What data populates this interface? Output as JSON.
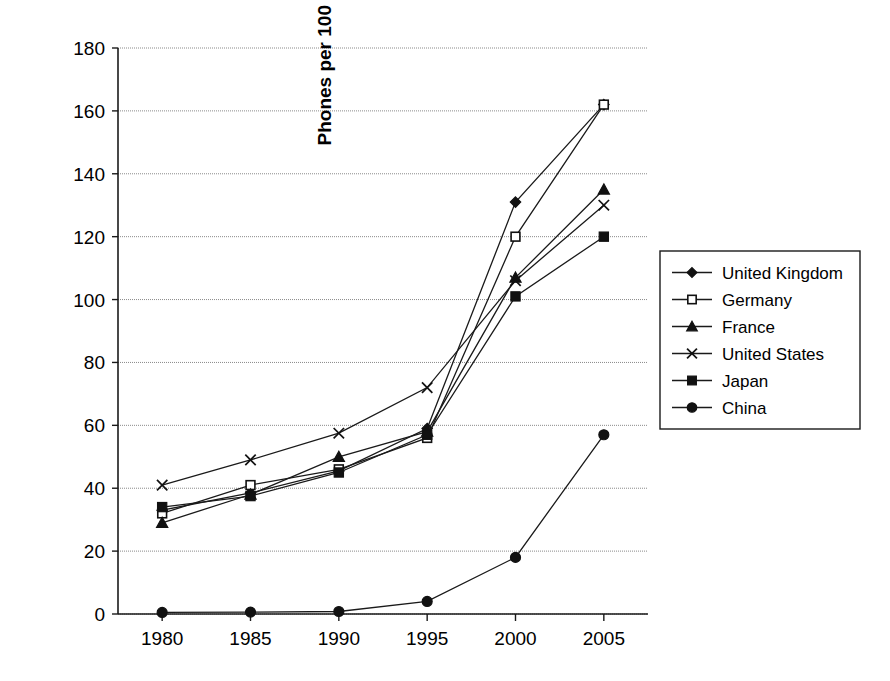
{
  "chart_data": {
    "type": "line",
    "title": "",
    "subtitle": "",
    "xlabel": "",
    "ylabel": "Phones per 100 people",
    "categories": [
      "1980",
      "1985",
      "1990",
      "1995",
      "2000",
      "2005"
    ],
    "x": [
      1980,
      1985,
      1990,
      1995,
      2000,
      2005
    ],
    "xlim": [
      1977.5,
      2007.5
    ],
    "ylim": [
      0,
      180
    ],
    "y_ticks": [
      0,
      20,
      40,
      60,
      80,
      100,
      120,
      140,
      160,
      180
    ],
    "y_tick_labels": [
      "0",
      "20",
      "40",
      "60",
      "80",
      "100",
      "120",
      "140",
      "160",
      "180"
    ],
    "grid": true,
    "legend_position": "right",
    "series": [
      {
        "name": "United Kingdom",
        "marker": "filled-diamond",
        "values": [
          33,
          38.5,
          45.5,
          59,
          131,
          162
        ]
      },
      {
        "name": "Germany",
        "marker": "open-square",
        "values": [
          32,
          41,
          46,
          56,
          120,
          162
        ]
      },
      {
        "name": "France",
        "marker": "filled-triangle",
        "values": [
          29,
          38,
          50,
          58,
          107,
          135
        ]
      },
      {
        "name": "United States",
        "marker": "cross-x",
        "values": [
          41,
          49,
          57.5,
          72,
          106,
          130
        ]
      },
      {
        "name": "Japan",
        "marker": "filled-square",
        "values": [
          34,
          37.5,
          45,
          57,
          101,
          120
        ]
      },
      {
        "name": "China",
        "marker": "filled-circle",
        "values": [
          0.5,
          0.6,
          0.8,
          4,
          18,
          57
        ]
      }
    ]
  },
  "legend": {
    "entries": [
      {
        "label": "United Kingdom"
      },
      {
        "label": "Germany"
      },
      {
        "label": "France"
      },
      {
        "label": "United States"
      },
      {
        "label": "Japan"
      },
      {
        "label": "China"
      }
    ]
  },
  "colors": {
    "ink": "#111111",
    "grid": "#8a8a8a",
    "background": "#ffffff"
  }
}
